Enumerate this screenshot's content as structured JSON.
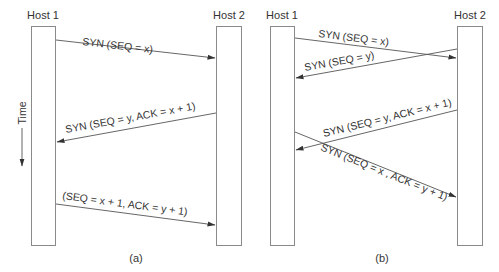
{
  "panels": [
    {
      "caption": "(a)",
      "host1_label": "Host 1",
      "host2_label": "Host 2",
      "time_label": "Time",
      "messages": [
        {
          "label": "SYN (SEQ = x)",
          "from": "Host 1",
          "to": "Host 2"
        },
        {
          "label": "SYN (SEQ = y, ACK = x + 1)",
          "from": "Host 2",
          "to": "Host 1"
        },
        {
          "label": "(SEQ = x + 1, ACK = y + 1)",
          "from": "Host 1",
          "to": "Host 2"
        }
      ]
    },
    {
      "caption": "(b)",
      "host1_label": "Host 1",
      "host2_label": "Host 2",
      "messages": [
        {
          "label": "SYN (SEQ = x)",
          "from": "Host 1",
          "to": "Host 2"
        },
        {
          "label": "SYN (SEQ = y)",
          "from": "Host 2",
          "to": "Host 1"
        },
        {
          "label": "SYN (SEQ = y, ACK = x + 1)",
          "from": "Host 2",
          "to": "Host 1"
        },
        {
          "label": "SYN (SEQ = x , ACK = y + 1)",
          "from": "Host 1",
          "to": "Host 2"
        }
      ]
    }
  ],
  "colors": {
    "line": "#555555",
    "bar_stroke": "#8a8a8a",
    "text": "#333333"
  }
}
